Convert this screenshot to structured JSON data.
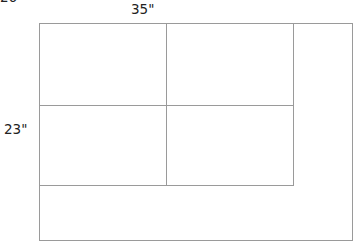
{
  "figure": {
    "type": "geometry-diagram",
    "background_color": "#ffffff",
    "line_color": "#9a9a9a",
    "text_color": "#222222"
  },
  "labels": {
    "top_width": "35\"",
    "left_height": "23\"",
    "clipped_top_left": "26\""
  },
  "chart_data": {
    "type": "diagram",
    "title": "",
    "units": "inches",
    "outer_rectangle": {
      "name": "outer-rectangle",
      "x": 39,
      "y": 23,
      "width": 313,
      "height": 217,
      "labeled_width": "35\"",
      "labeled_height": "23\""
    },
    "interior_lines": [
      {
        "name": "horizontal-divider-upper",
        "orientation": "horizontal",
        "x1": 39,
        "y1": 105,
        "x2": 293,
        "y2": 105
      },
      {
        "name": "horizontal-divider-lower",
        "orientation": "horizontal",
        "x1": 39,
        "y1": 185,
        "x2": 293,
        "y2": 185
      },
      {
        "name": "vertical-divider-left",
        "orientation": "vertical",
        "x1": 166,
        "y1": 23,
        "x2": 166,
        "y2": 185
      },
      {
        "name": "vertical-divider-right",
        "orientation": "vertical",
        "x1": 293,
        "y1": 23,
        "x2": 293,
        "y2": 185
      }
    ],
    "cells": [
      {
        "name": "cell-top-left",
        "x": 39,
        "y": 23,
        "width": 127,
        "height": 82
      },
      {
        "name": "cell-top-middle",
        "x": 166,
        "y": 23,
        "width": 127,
        "height": 82
      },
      {
        "name": "cell-bottom-left",
        "x": 39,
        "y": 105,
        "width": 127,
        "height": 80
      },
      {
        "name": "cell-bottom-middle",
        "x": 166,
        "y": 105,
        "width": 127,
        "height": 80
      },
      {
        "name": "cell-right-column",
        "x": 293,
        "y": 23,
        "width": 59,
        "height": 162
      },
      {
        "name": "cell-bottom-strip",
        "x": 39,
        "y": 185,
        "width": 313,
        "height": 55
      }
    ]
  }
}
